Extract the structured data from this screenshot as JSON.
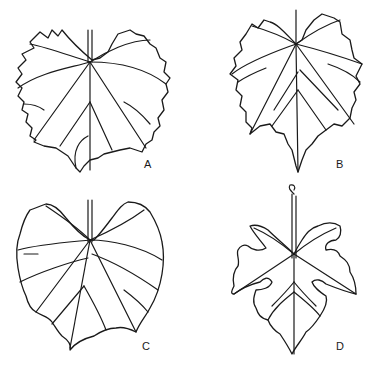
{
  "figure": {
    "panels": [
      {
        "id": "A",
        "label": "A",
        "description": "broad cordate grape leaf, shallow lobes, dentate margin"
      },
      {
        "id": "B",
        "label": "B",
        "description": "ovate grape leaf with acuminate tip, serrate margin"
      },
      {
        "id": "C",
        "label": "C",
        "description": "broad cordate leaf with wide open sinus, crenate margin"
      },
      {
        "id": "D",
        "label": "D",
        "description": "deeply five-lobed grape leaf with rounded sinuses and tendril-tipped petiole"
      }
    ],
    "colors": {
      "line": "#1a1a1a",
      "background": "#ffffff"
    }
  }
}
